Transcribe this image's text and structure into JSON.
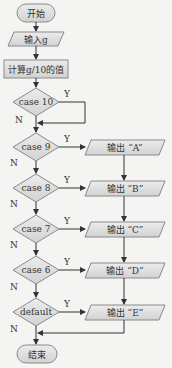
{
  "colors": {
    "shape_fill": "#dcdcdc",
    "shape_stroke": "#8a8a8a",
    "line": "#333333",
    "background": "#f4f4f2"
  },
  "nodes": {
    "start": "开始",
    "input": "输入g",
    "compute": "计算g/10的值",
    "end": "结束"
  },
  "decisions": [
    {
      "label": "case 10",
      "yes": "Y",
      "no": "N"
    },
    {
      "label": "case 9",
      "yes": "Y",
      "no": "N"
    },
    {
      "label": "case 8",
      "yes": "Y",
      "no": "N"
    },
    {
      "label": "case 7",
      "yes": "Y",
      "no": "N"
    },
    {
      "label": "case 6",
      "yes": "Y",
      "no": "N"
    },
    {
      "label": "default",
      "yes": "Y",
      "no": "N"
    }
  ],
  "outputs": [
    {
      "label": "输出 “A”"
    },
    {
      "label": "输出 “B”"
    },
    {
      "label": "输出 “C”"
    },
    {
      "label": "输出 “D”"
    },
    {
      "label": "输出 “E”"
    }
  ]
}
